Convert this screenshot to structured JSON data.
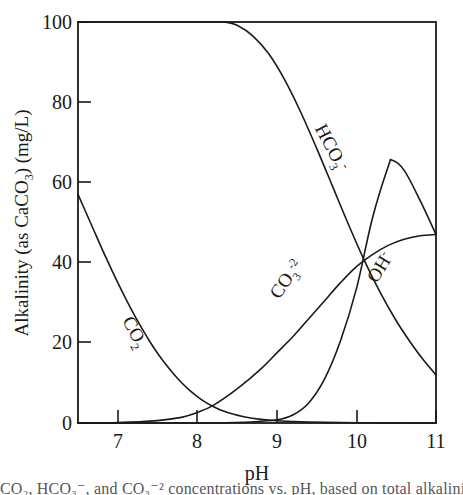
{
  "chart_data": {
    "type": "line",
    "title": "",
    "xlabel": "pH",
    "ylabel": "Alkalinity (as CaCO3) (mg/L)",
    "ylabel_parts": {
      "prefix": "Alkalinity (as CaCO",
      "sub": "3",
      "suffix": ") (mg/L)"
    },
    "xlim": [
      6.5,
      11
    ],
    "ylim": [
      0,
      100
    ],
    "xticks": [
      7,
      8,
      9,
      10,
      11
    ],
    "yticks": [
      0,
      20,
      40,
      60,
      80,
      100
    ],
    "xtick_labels": [
      "7",
      "8",
      "9",
      "10",
      "11"
    ],
    "ytick_labels": [
      "0",
      "20",
      "40",
      "60",
      "80",
      "100"
    ],
    "grid": false,
    "legend": "inline-curve-labels",
    "series": [
      {
        "name": "CO2",
        "label": "CO₂",
        "label_parts": {
          "base": "CO",
          "sub": "2",
          "sup": ""
        },
        "label_x": 7.15,
        "label_y": 22,
        "label_rotation": 62,
        "x": [
          6.5,
          6.6,
          6.7,
          6.8,
          6.9,
          7.0,
          7.1,
          7.2,
          7.3,
          7.4,
          7.5,
          7.6,
          7.7,
          7.8,
          7.9,
          8.0,
          8.1,
          8.2,
          8.3,
          8.4,
          8.6,
          8.8,
          9.0,
          9.3,
          9.6,
          10.0,
          10.5,
          11.0
        ],
        "y": [
          57.0,
          52.5,
          48.0,
          43.5,
          39.2,
          35.0,
          31.0,
          27.2,
          23.7,
          20.4,
          17.4,
          14.7,
          12.3,
          10.1,
          8.2,
          6.6,
          5.2,
          4.1,
          3.2,
          2.5,
          1.5,
          0.9,
          0.55,
          0.3,
          0.15,
          0.06,
          0.02,
          0.0
        ]
      },
      {
        "name": "HCO3-",
        "label": "HCO₃⁻",
        "label_parts": {
          "base": "HCO",
          "sub": "3",
          "sup": "-"
        },
        "label_x": 9.62,
        "label_y": 68,
        "label_rotation": 62,
        "x": [
          6.5,
          7.0,
          7.5,
          8.0,
          8.2,
          8.35,
          8.5,
          8.7,
          8.9,
          9.1,
          9.3,
          9.5,
          9.7,
          9.9,
          10.1,
          10.3,
          10.5,
          10.7,
          10.85,
          11.0
        ],
        "y": [
          100,
          100,
          100,
          100,
          100,
          100,
          99.2,
          96.5,
          92.0,
          85.5,
          77.5,
          68.5,
          59.0,
          49.5,
          40.5,
          32.5,
          25.5,
          19.5,
          15.5,
          12.0
        ]
      },
      {
        "name": "CO3-2",
        "label": "CO₃⁻²",
        "label_parts": {
          "base": "CO",
          "sub": "3",
          "sup": "-2"
        },
        "label_x": 9.18,
        "label_y": 35,
        "label_rotation": -55,
        "x": [
          6.5,
          7.0,
          7.5,
          7.8,
          8.0,
          8.2,
          8.5,
          8.8,
          9.0,
          9.2,
          9.4,
          9.6,
          9.8,
          10.0,
          10.2,
          10.4,
          10.6,
          10.8,
          11.0
        ],
        "y": [
          0.0,
          0.1,
          0.6,
          1.4,
          2.6,
          4.4,
          8.5,
          13.5,
          17.5,
          21.5,
          26.0,
          30.5,
          35.0,
          39.0,
          42.0,
          44.3,
          45.8,
          46.7,
          47.0
        ]
      },
      {
        "name": "OH-",
        "label": "OH⁻",
        "label_parts": {
          "base": "OH",
          "sub": "",
          "sup": "-"
        },
        "label_x": 10.36,
        "label_y": 38,
        "label_rotation": -58,
        "x": [
          6.5,
          8.0,
          8.6,
          9.0,
          9.2,
          9.4,
          9.6,
          9.8,
          10.0,
          10.2,
          10.4,
          10.45,
          10.6,
          10.8,
          11.0
        ],
        "y": [
          0.0,
          0.0,
          0.2,
          0.8,
          2.0,
          5.0,
          11.0,
          20.5,
          33.5,
          51.0,
          64.0,
          65.5,
          63.0,
          55.5,
          47.0
        ]
      }
    ],
    "annotations": [
      {
        "name": "co2-co3-crossing",
        "x": 8.0,
        "y": 3.0
      },
      {
        "name": "hco3-co3-crossing",
        "x": 9.93,
        "y": 48.0
      },
      {
        "name": "hco3-oh-crossing",
        "x": 10.28,
        "y": 39.0
      },
      {
        "name": "co3-oh-crossing",
        "x": 11.0,
        "y": 47.0
      },
      {
        "name": "oh-peak",
        "x": 10.45,
        "y": 65.5
      }
    ]
  },
  "caption": {
    "text": "CO₂, HCO₃⁻, and CO₃⁻² concentrations vs. pH, based on total alkalinity of 100 mg/L"
  }
}
